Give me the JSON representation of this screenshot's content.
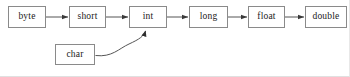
{
  "diagram": {
    "background_color": "#ffffff",
    "line_color": "#555555",
    "box_border_color": "#8a8a8a",
    "text_color": "#1a1a1a",
    "nodes": [
      {
        "id": "byte",
        "label": "byte",
        "x": 8,
        "y": 6,
        "w": 38,
        "h": 22
      },
      {
        "id": "short",
        "label": "short",
        "x": 69,
        "y": 6,
        "w": 37,
        "h": 22
      },
      {
        "id": "int",
        "label": "int",
        "x": 129,
        "y": 6,
        "w": 38,
        "h": 22
      },
      {
        "id": "long",
        "label": "long",
        "x": 189,
        "y": 6,
        "w": 39,
        "h": 22
      },
      {
        "id": "float",
        "label": "float",
        "x": 248,
        "y": 6,
        "w": 37,
        "h": 22
      },
      {
        "id": "double",
        "label": "double",
        "x": 305,
        "y": 6,
        "w": 42,
        "h": 22
      },
      {
        "id": "char",
        "label": "char",
        "x": 55,
        "y": 44,
        "w": 40,
        "h": 21
      }
    ],
    "edges": [
      {
        "id": "byte-to-short",
        "from": "byte",
        "to": "short",
        "kind": "straight",
        "x1": 46,
        "y1": 17,
        "x2": 69,
        "y2": 17
      },
      {
        "id": "short-to-int",
        "from": "short",
        "to": "int",
        "kind": "straight",
        "x1": 106,
        "y1": 17,
        "x2": 129,
        "y2": 17
      },
      {
        "id": "int-to-long",
        "from": "int",
        "to": "long",
        "kind": "straight",
        "x1": 167,
        "y1": 17,
        "x2": 189,
        "y2": 17
      },
      {
        "id": "long-to-float",
        "from": "long",
        "to": "float",
        "kind": "straight",
        "x1": 228,
        "y1": 17,
        "x2": 248,
        "y2": 17
      },
      {
        "id": "float-to-double",
        "from": "float",
        "to": "double",
        "kind": "straight",
        "x1": 285,
        "y1": 17,
        "x2": 305,
        "y2": 17
      },
      {
        "id": "char-to-int",
        "from": "char",
        "to": "int",
        "kind": "curved",
        "path": "M 95.5,55.5 C 112,57 120,48 130,44 C 140,40 144,36 145.5,30"
      }
    ]
  }
}
